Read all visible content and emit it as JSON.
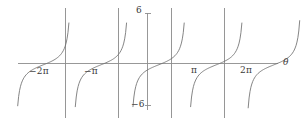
{
  "figure": {
    "title": "",
    "background_color": "#ffffff",
    "width": 301,
    "height": 126
  },
  "labels": {
    "y_max": "6",
    "y_min": "−6",
    "x_neg_two_pi": "−2π",
    "x_neg_pi": "−π",
    "x_pi": "π",
    "x_two_pi": "2π",
    "x_axis_variable": "θ"
  },
  "chart_data": {
    "type": "line",
    "title": "",
    "subtitle": "",
    "xlabel": "θ",
    "ylabel": "",
    "function": "y = tan(θ)",
    "xlim": [
      -8.64,
      7.76
    ],
    "ylim": [
      -8.3,
      8.8
    ],
    "xtick_values": [
      -6.283185,
      -3.141593,
      3.141593,
      6.283185
    ],
    "xtick_labels": [
      "−2π",
      "−π",
      "π",
      "2π"
    ],
    "ytick_values": [
      6,
      -6
    ],
    "ytick_labels": [
      "6",
      "−6"
    ],
    "grid": false,
    "legend": null,
    "legend_position": "none",
    "axis_color": "#8c8c8c",
    "curve_color": "#6f6f6f",
    "asymptote_color": "#8a8a8a",
    "asymptotes": [
      -4.712389,
      -1.570796,
      1.570796,
      4.712389
    ],
    "asymptotes_drawn_as": "vertical lines",
    "branch_count": 5,
    "series": [
      {
        "name": "tan(θ)",
        "points_per_branch": 61,
        "branches": [
          {
            "x_range": [
              -7.85,
              -4.712389
            ],
            "note": "leftmost partial branch, clipped at left edge"
          },
          {
            "x_range": [
              -4.712389,
              -1.570796
            ],
            "note": "branch through −2π"
          },
          {
            "x_range": [
              -1.570796,
              1.570796
            ],
            "note": "central branch through origin"
          },
          {
            "x_range": [
              1.570796,
              4.712389
            ],
            "note": "branch through π"
          },
          {
            "x_range": [
              4.712389,
              7.76
            ],
            "note": "rightmost partial branch through 2π, clipped at top"
          }
        ]
      }
    ]
  }
}
